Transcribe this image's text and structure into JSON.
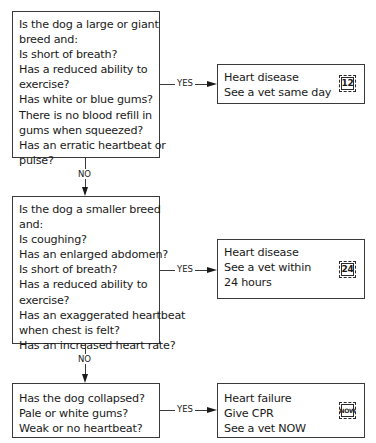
{
  "diagram": {
    "type": "flowchart",
    "questions": [
      {
        "lines": [
          "Is the dog a large or giant",
          "breed and:",
          "Is short of breath?",
          "Has a reduced ability to",
          "exercise?",
          "Has white or blue gums?",
          "There is no blood refill in",
          "gums when squeezed?",
          "Has an erratic heartbeat or",
          "pulse?"
        ],
        "yes_label": "YES",
        "no_label": "NO"
      },
      {
        "lines": [
          "Is the dog a smaller breed",
          "and:",
          "Is coughing?",
          "Has an enlarged abdomen?",
          "Is short of breath?",
          "Has a reduced ability to",
          "exercise?",
          "Has an exaggerated heartbeat",
          "when chest is felt?",
          "Has an increased heart rate?"
        ],
        "yes_label": "YES",
        "no_label": "NO"
      },
      {
        "lines": [
          "Has the dog collapsed?",
          "Pale or white gums?",
          "Weak or no heartbeat?"
        ],
        "yes_label": "YES"
      }
    ],
    "outcomes": [
      {
        "lines": [
          "Heart disease",
          "See a vet same day"
        ],
        "badge": "12",
        "badge_icon": "clock-12-icon"
      },
      {
        "lines": [
          "Heart disease",
          "See a vet within",
          "24 hours"
        ],
        "badge": "24",
        "badge_icon": "clock-24-icon"
      },
      {
        "lines": [
          "Heart failure",
          "Give CPR",
          "See a vet NOW"
        ],
        "badge": "NOW",
        "badge_icon": "urgent-now-icon"
      }
    ]
  }
}
